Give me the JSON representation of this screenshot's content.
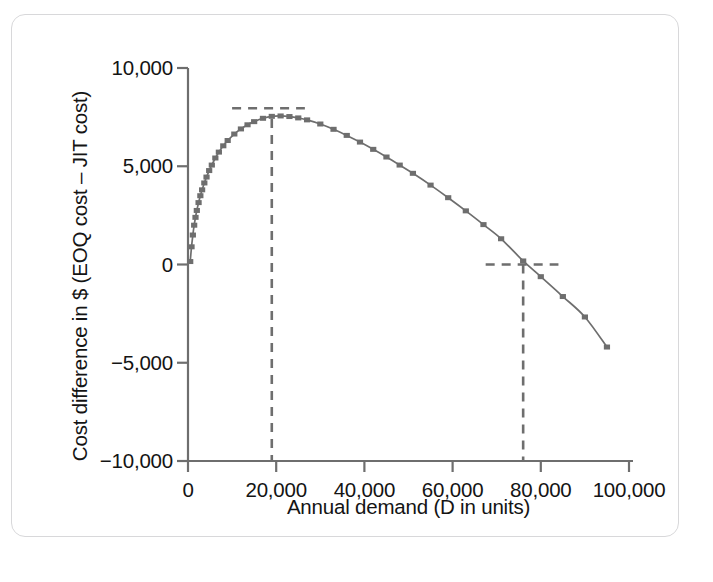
{
  "figure": {
    "frame_color": "#d8d8da",
    "background": "#ffffff"
  },
  "chart_data": {
    "type": "line",
    "title": "",
    "xlabel": "Annual demand (D in units)",
    "ylabel": "Cost difference in $ (EOQ cost – JIT cost)",
    "xlim": [
      0,
      100000
    ],
    "ylim": [
      -10000,
      10000
    ],
    "grid": false,
    "legend": "none",
    "line_color": "#6e6e6e",
    "marker": "square",
    "marker_color": "#6e6e6e",
    "x_ticks": [
      0,
      20000,
      40000,
      60000,
      80000,
      100000
    ],
    "x_tick_labels": [
      "0",
      "20,000",
      "40,000",
      "60,000",
      "80,000",
      "100,000"
    ],
    "y_ticks": [
      -10000,
      -5000,
      0,
      5000,
      10000
    ],
    "y_tick_labels": [
      "−10,000",
      "−5,000",
      "0",
      "5,000",
      "10,000"
    ],
    "series": [
      {
        "name": "EOQ cost – JIT cost",
        "x": [
          500,
          800,
          1100,
          1400,
          1700,
          2000,
          2400,
          2800,
          3200,
          3700,
          4200,
          4800,
          5400,
          6200,
          7000,
          8000,
          9000,
          10500,
          12000,
          13500,
          15000,
          17000,
          19000,
          21000,
          23000,
          25000,
          27000,
          30000,
          33000,
          36000,
          39000,
          42000,
          45000,
          48000,
          51000,
          55000,
          59000,
          63000,
          67000,
          71000,
          76000,
          80000,
          85000,
          90000,
          95000
        ],
        "y": [
          150,
          900,
          1500,
          2000,
          2400,
          2750,
          3150,
          3500,
          3800,
          4150,
          4450,
          4780,
          5060,
          5420,
          5720,
          6040,
          6310,
          6640,
          6900,
          7110,
          7270,
          7440,
          7540,
          7560,
          7530,
          7460,
          7360,
          7150,
          6880,
          6570,
          6230,
          5860,
          5470,
          5060,
          4640,
          4040,
          3400,
          2730,
          2030,
          1310,
          180,
          -620,
          -1630,
          -2670,
          -4200
        ]
      }
    ],
    "annotations": [
      {
        "name": "peak-horizontal-dashed",
        "type": "dashed_hline",
        "y": 7950,
        "x_start": 10000,
        "x_end": 26500
      },
      {
        "name": "peak-vertical-dashed",
        "type": "dashed_vline",
        "x": 19000,
        "y_start": 7400,
        "y_end": -10000
      },
      {
        "name": "breakeven-horizontal-dashed",
        "type": "dashed_hline",
        "y": 0,
        "x_start": 67500,
        "x_end": 84000
      },
      {
        "name": "breakeven-vertical-dashed",
        "type": "dashed_vline",
        "x": 76000,
        "y_start": 0,
        "y_end": -10000
      }
    ]
  }
}
